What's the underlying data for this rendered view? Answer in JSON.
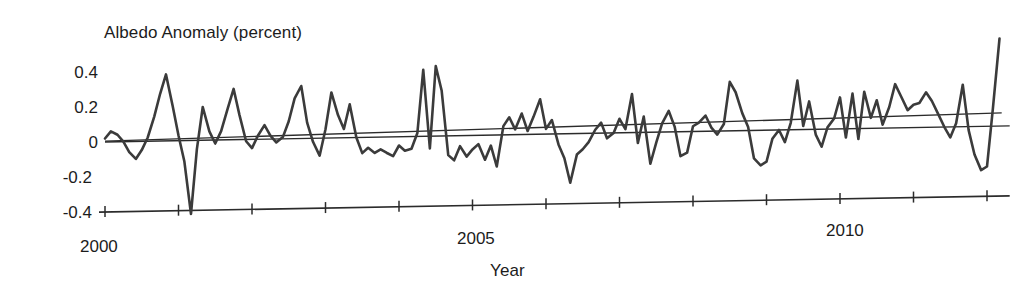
{
  "chart_data": {
    "type": "line",
    "title": "Albedo Anomaly (percent)",
    "xlabel": "Year",
    "ylabel": "Albedo Anomaly (percent)",
    "ylim": [
      -0.4,
      0.4
    ],
    "xlim": [
      2000.0,
      2012.2
    ],
    "grid": false,
    "legend": "none",
    "y_ticks": [
      "0.4",
      "0.2",
      "0",
      "-0.2",
      "-0.4"
    ],
    "y_tick_values": [
      0.4,
      0.2,
      0,
      -0.2,
      -0.4
    ],
    "x_ticks": [
      "2000",
      "2005",
      "2010"
    ],
    "x_tick_values": [
      2000,
      2005,
      2010
    ],
    "x_minor_tick_values": [
      2000,
      2001,
      2002,
      2003,
      2004,
      2005,
      2006,
      2007,
      2008,
      2009,
      2010,
      2011,
      2012
    ],
    "series": [
      {
        "name": "Albedo anomaly",
        "color": "#3b3b3b",
        "x": [
          2000.0,
          2000.08,
          2000.17,
          2000.25,
          2000.33,
          2000.42,
          2000.5,
          2000.58,
          2000.67,
          2000.75,
          2000.83,
          2000.92,
          2001.0,
          2001.08,
          2001.17,
          2001.25,
          2001.33,
          2001.42,
          2001.5,
          2001.58,
          2001.67,
          2001.75,
          2001.83,
          2001.92,
          2002.0,
          2002.08,
          2002.17,
          2002.25,
          2002.33,
          2002.42,
          2002.5,
          2002.58,
          2002.67,
          2002.75,
          2002.83,
          2002.92,
          2003.0,
          2003.08,
          2003.17,
          2003.25,
          2003.33,
          2003.42,
          2003.5,
          2003.58,
          2003.67,
          2003.75,
          2003.83,
          2003.92,
          2004.0,
          2004.08,
          2004.17,
          2004.25,
          2004.33,
          2004.42,
          2004.5,
          2004.58,
          2004.67,
          2004.75,
          2004.83,
          2004.92,
          2005.0,
          2005.08,
          2005.17,
          2005.25,
          2005.33,
          2005.42,
          2005.5,
          2005.58,
          2005.67,
          2005.75,
          2005.83,
          2005.92,
          2006.0,
          2006.08,
          2006.17,
          2006.25,
          2006.33,
          2006.42,
          2006.5,
          2006.58,
          2006.67,
          2006.75,
          2006.83,
          2006.92,
          2007.0,
          2007.08,
          2007.17,
          2007.25,
          2007.33,
          2007.42,
          2007.5,
          2007.58,
          2007.67,
          2007.75,
          2007.83,
          2007.92,
          2008.0,
          2008.08,
          2008.17,
          2008.25,
          2008.33,
          2008.42,
          2008.5,
          2008.58,
          2008.67,
          2008.75,
          2008.83,
          2008.92,
          2009.0,
          2009.08,
          2009.17,
          2009.25,
          2009.33,
          2009.42,
          2009.5,
          2009.58,
          2009.67,
          2009.75,
          2009.83,
          2009.92,
          2010.0,
          2010.08,
          2010.17,
          2010.25,
          2010.33,
          2010.42,
          2010.5,
          2010.58,
          2010.67,
          2010.75,
          2010.83,
          2010.92,
          2011.0,
          2011.08,
          2011.17,
          2011.25,
          2011.33,
          2011.42,
          2011.5,
          2011.58,
          2011.67,
          2011.75,
          2011.83,
          2011.92,
          2012.0,
          2012.08,
          2012.17
        ],
        "values": [
          0.02,
          0.06,
          0.04,
          0.0,
          -0.06,
          -0.1,
          -0.05,
          0.02,
          0.14,
          0.27,
          0.38,
          0.2,
          0.03,
          -0.12,
          -0.42,
          -0.05,
          0.19,
          0.05,
          -0.02,
          0.05,
          0.18,
          0.29,
          0.14,
          -0.01,
          -0.05,
          0.02,
          0.08,
          0.02,
          -0.02,
          0.01,
          0.1,
          0.23,
          0.3,
          0.09,
          -0.02,
          -0.1,
          0.05,
          0.26,
          0.13,
          0.05,
          0.19,
          0.0,
          -0.09,
          -0.06,
          -0.09,
          -0.07,
          -0.09,
          -0.11,
          -0.05,
          -0.08,
          -0.07,
          0.02,
          0.38,
          -0.07,
          0.4,
          0.26,
          -0.11,
          -0.14,
          -0.06,
          -0.12,
          -0.08,
          -0.05,
          -0.14,
          -0.06,
          -0.18,
          0.05,
          0.1,
          0.03,
          0.12,
          0.02,
          0.1,
          0.2,
          0.03,
          0.08,
          -0.06,
          -0.14,
          -0.28,
          -0.12,
          -0.09,
          -0.05,
          0.02,
          0.06,
          -0.03,
          0.0,
          0.08,
          0.02,
          0.22,
          -0.06,
          0.09,
          -0.18,
          -0.06,
          0.05,
          0.12,
          0.03,
          -0.14,
          -0.12,
          0.03,
          0.05,
          0.09,
          0.02,
          -0.02,
          0.04,
          0.28,
          0.22,
          0.1,
          0.02,
          -0.16,
          -0.2,
          -0.18,
          -0.05,
          0.0,
          -0.07,
          0.04,
          0.28,
          0.02,
          0.16,
          -0.03,
          -0.1,
          0.01,
          0.06,
          0.18,
          -0.05,
          0.2,
          -0.06,
          0.21,
          0.06,
          0.16,
          0.02,
          0.12,
          0.25,
          0.18,
          0.1,
          0.13,
          0.14,
          0.2,
          0.15,
          0.08,
          0.0,
          -0.06,
          0.02,
          0.24,
          -0.02,
          -0.16,
          -0.25,
          -0.23,
          0.1,
          0.5
        ]
      }
    ],
    "trendline": {
      "name": "Linear trend",
      "color": "#2b2b2b",
      "x": [
        2000.0,
        2012.2
      ],
      "values": [
        0.005,
        0.075
      ]
    }
  }
}
